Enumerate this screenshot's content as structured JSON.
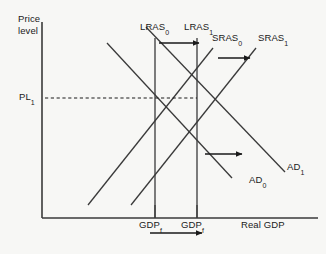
{
  "figure": {
    "type": "ad-as macroeconomic diagram",
    "background_color": "#f7f7f5",
    "line_color": "#3a3a3a",
    "text_color": "#1a1a1a"
  },
  "axes": {
    "y_label": "Price\nlevel",
    "x_label": "Real GDP",
    "origin": {
      "x": 42,
      "y": 218
    },
    "x_end": 318,
    "y_top": 22
  },
  "price_level": {
    "label": "PL",
    "subscript": "1",
    "y": 98,
    "dash_from_x": 45,
    "dash_to_x": 197
  },
  "curves": {
    "lras0": {
      "label": "LRAS",
      "subscript": "0",
      "x": 155,
      "y_top": 38,
      "y_bottom": 218
    },
    "lras1": {
      "label": "LRAS",
      "subscript": "1",
      "x": 197,
      "y_top": 38,
      "y_bottom": 218
    },
    "sras0": {
      "label": "SRAS",
      "subscript": "0",
      "x1": 88,
      "y1": 205,
      "x2": 213,
      "y2": 48
    },
    "sras1": {
      "label": "SRAS",
      "subscript": "1",
      "x1": 131,
      "y1": 205,
      "x2": 256,
      "y2": 48
    },
    "ad0": {
      "label": "AD",
      "subscript": "0",
      "x1": 107,
      "y1": 43,
      "x2": 232,
      "y2": 178
    },
    "ad1": {
      "label": "AD",
      "subscript": "1",
      "x1": 146,
      "y1": 27,
      "x2": 285,
      "y2": 172
    }
  },
  "labels": {
    "lras0": {
      "text": "LRAS",
      "sub": "0",
      "x": 141,
      "y": 22
    },
    "lras1": {
      "text": "LRAS",
      "sub": "1",
      "x": 185,
      "y": 22
    },
    "sras0": {
      "text": "SRAS",
      "sub": "0",
      "x": 213,
      "y": 33
    },
    "sras1": {
      "text": "SRAS",
      "sub": "1",
      "x": 258,
      "y": 33
    },
    "ad0": {
      "text": "AD",
      "sub": "0",
      "x": 249,
      "y": 175
    },
    "ad1": {
      "text": "AD",
      "sub": "1",
      "x": 287,
      "y": 162
    },
    "pl1": {
      "text": "PL",
      "sub": "1",
      "x": 19,
      "y": 92
    },
    "gdp_f0": {
      "text": "GDP",
      "sub": "f",
      "x": 140,
      "y": 219
    },
    "gdp_f1": {
      "text": "GDP",
      "sub": "f",
      "x": 182,
      "y": 219
    },
    "real_gdp": {
      "text": "Real GDP",
      "x": 241,
      "y": 219
    },
    "price_level": {
      "text": "Price\nlevel",
      "x": 18,
      "y": 14
    }
  },
  "arrows": {
    "lras_shift": {
      "name": "lras-shift-arrow",
      "x1": 159,
      "y1": 43,
      "x2": 201,
      "y2": 43
    },
    "sras_shift": {
      "name": "sras-shift-arrow",
      "x1": 218,
      "y1": 58,
      "x2": 252,
      "y2": 58
    },
    "ad_shift": {
      "name": "ad-shift-arrow",
      "x1": 205,
      "y1": 154,
      "x2": 244,
      "y2": 154
    },
    "gdp_shift": {
      "name": "gdp-shift-arrow",
      "x1": 150,
      "y1": 233,
      "x2": 204,
      "y2": 233
    }
  }
}
